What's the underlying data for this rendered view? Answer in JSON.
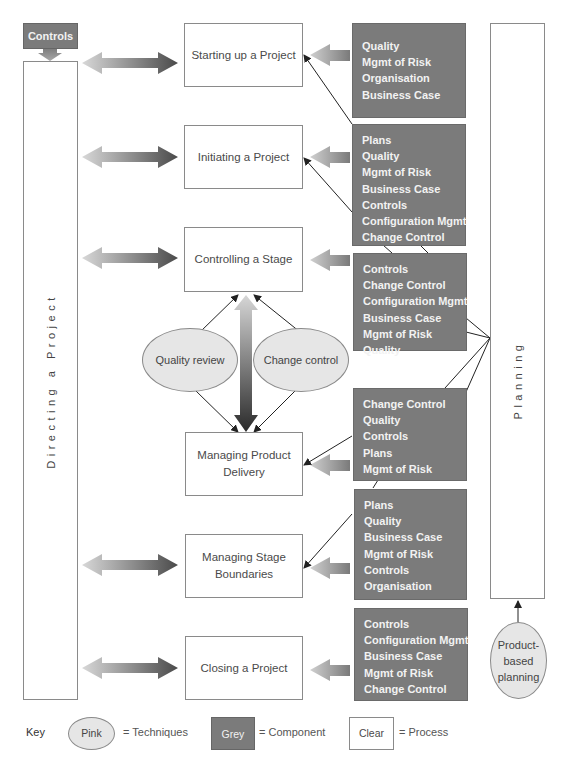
{
  "diagram": {
    "controls_box": "Controls",
    "directing": "Directing a Project",
    "planning": "Planning",
    "processes": [
      {
        "id": "starting-up",
        "label": "Starting up a Project"
      },
      {
        "id": "initiating",
        "label": "Initiating a Project"
      },
      {
        "id": "controlling-stage",
        "label": "Controlling a Stage"
      },
      {
        "id": "managing-product-delivery",
        "label": "Managing Product Delivery"
      },
      {
        "id": "managing-stage-boundaries",
        "label": "Managing Stage Boundaries"
      },
      {
        "id": "closing",
        "label": "Closing a Project"
      }
    ],
    "components": [
      {
        "for": "starting-up",
        "items": [
          "Quality",
          "Mgmt of Risk",
          "Organisation",
          "Business Case"
        ]
      },
      {
        "for": "initiating",
        "items": [
          "Plans",
          "Quality",
          "Mgmt of Risk",
          "Business Case",
          "Controls",
          "Configuration Mgmt",
          "Change Control"
        ]
      },
      {
        "for": "controlling-stage",
        "items": [
          "Controls",
          "Change Control",
          "Configuration Mgmt",
          "Business Case",
          "Mgmt of Risk",
          "Quality"
        ]
      },
      {
        "for": "managing-product-delivery",
        "items": [
          "Change Control",
          "Quality",
          "Controls",
          "Plans",
          "Mgmt of Risk"
        ]
      },
      {
        "for": "managing-stage-boundaries",
        "items": [
          "Plans",
          "Quality",
          "Business Case",
          "Mgmt of Risk",
          "Controls",
          "Organisation"
        ]
      },
      {
        "for": "closing",
        "items": [
          "Controls",
          "Configuration Mgmt",
          "Business Case",
          "Mgmt of Risk",
          "Change Control"
        ]
      }
    ],
    "techniques": [
      {
        "label": "Quality review"
      },
      {
        "label": "Change control"
      },
      {
        "label": "Product-based planning"
      }
    ],
    "product_based_lines": [
      "Product-",
      "based",
      "planning"
    ],
    "managing_product_delivery_lines": [
      "Managing Product",
      "Delivery"
    ],
    "managing_stage_boundaries_lines": [
      "Managing Stage",
      "Boundaries"
    ]
  },
  "key": {
    "title": "Key",
    "techniques_swatch": "Pink",
    "techniques_text": "= Techniques",
    "component_swatch": "Grey",
    "component_text": "= Component",
    "process_swatch": "Clear",
    "process_text": "= Process"
  },
  "colors": {
    "component_grey": "#7b7b7b",
    "technique_fill": "#e6e6e6",
    "process_fill": "#ffffff",
    "line": "#222222"
  }
}
